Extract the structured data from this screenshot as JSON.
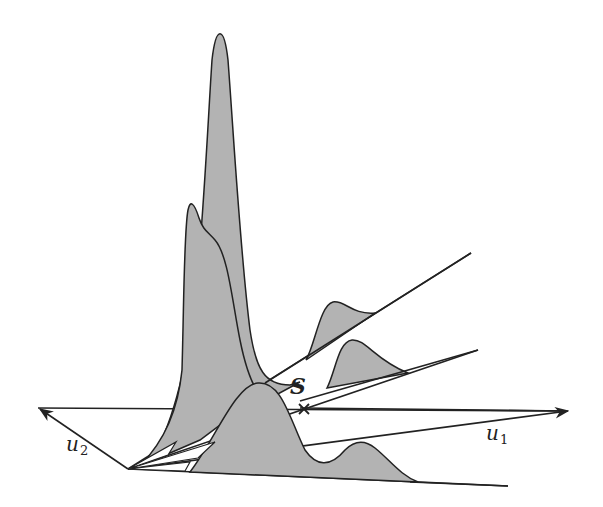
{
  "diagram": {
    "title": "",
    "labels": {
      "u1": {
        "text": "u",
        "sub": "1"
      },
      "u2": {
        "text": "u",
        "sub": "2"
      },
      "s": "S"
    },
    "colors": {
      "fill": "#b3b3b3",
      "stroke": "#222222",
      "background": "#ffffff"
    },
    "elements": [
      "origin point with fan of rays",
      "u1 axis arrow (pointing right)",
      "u2 axis arrow (pointing upper-left)",
      "tall narrow density peak",
      "secondary density peak with shoulder",
      "bimodal density along bottom ray",
      "small density bumps on upper two rays",
      "marked point S (cross) on u1 axis"
    ]
  }
}
